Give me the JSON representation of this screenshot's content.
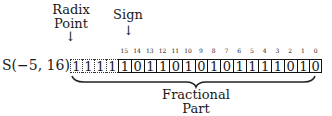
{
  "format_label": "S(−5, 16)",
  "radix_point": {
    "line1": "Radix",
    "line2": "Point",
    "arrow": "↓"
  },
  "sign": {
    "label": "Sign",
    "arrow": "↓"
  },
  "fractional_part": {
    "line1": "Fractional",
    "line2": "Part"
  },
  "extension_bits": [
    "1",
    "1",
    "1",
    "1"
  ],
  "bit_indices": [
    "15",
    "14",
    "13",
    "12",
    "11",
    "10",
    "9",
    "8",
    "7",
    "6",
    "5",
    "4",
    "3",
    "2",
    "1",
    "0"
  ],
  "bits": [
    "1",
    "0",
    "1",
    "1",
    "0",
    "1",
    "0",
    "1",
    "0",
    "1",
    "1",
    "1",
    "1",
    "0",
    "1",
    "0"
  ]
}
